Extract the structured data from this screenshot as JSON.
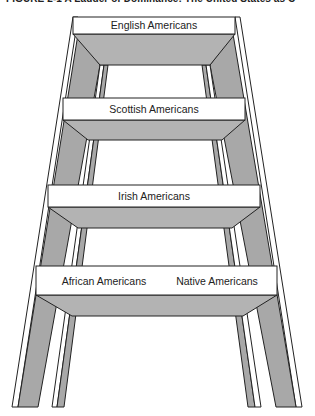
{
  "figure": {
    "title": "FIGURE 2-1   A Ladder of Dominance: The United States as C",
    "colors": {
      "shelf_gray": "#b3b3b3",
      "leg_gray": "#a8a8a8",
      "outline": "#222222",
      "rung_face": "#ffffff"
    }
  },
  "ladder": {
    "rungs": [
      {
        "level": 1,
        "labels": [
          "English Americans"
        ]
      },
      {
        "level": 2,
        "labels": [
          "Scottish Americans"
        ]
      },
      {
        "level": 3,
        "labels": [
          "Irish Americans"
        ]
      },
      {
        "level": 4,
        "labels": [
          "African Americans",
          "Native Americans"
        ]
      }
    ]
  }
}
